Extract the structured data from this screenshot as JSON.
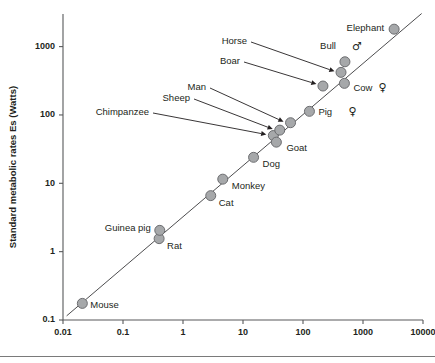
{
  "chart_data": {
    "type": "scatter",
    "title": "",
    "xlabel": "",
    "ylabel": "Standard metabolic rates Es (Watts)",
    "xscale": "log",
    "yscale": "log",
    "xlim": [
      0.01,
      10000
    ],
    "ylim": [
      0.1,
      3000
    ],
    "grid": false,
    "legend": null,
    "xticks": [
      "0.01",
      "0.1",
      "1",
      "10",
      "100",
      "1000",
      "10000"
    ],
    "xtick_values": [
      0.01,
      0.1,
      1,
      10,
      100,
      1000,
      10000
    ],
    "yticks": [
      "0.1",
      "1",
      "10",
      "100",
      "1000"
    ],
    "ytick_values": [
      0.1,
      1,
      10,
      100,
      1000
    ],
    "fit_line": {
      "label": "",
      "x_start": 0.0115,
      "y_start": 0.115,
      "x_end": 9500,
      "y_end": 3050
    },
    "points": [
      {
        "name": "Mouse",
        "x": 0.021,
        "y": 0.175,
        "label": "Mouse",
        "label_pos": "right",
        "sex": ""
      },
      {
        "name": "Rat",
        "x": 0.4,
        "y": 1.55,
        "label": "Rat",
        "label_pos": "right",
        "sex": ""
      },
      {
        "name": "Guinea pig",
        "x": 0.41,
        "y": 2.05,
        "label": "Guinea pig",
        "label_pos": "left",
        "sex": ""
      },
      {
        "name": "Cat",
        "x": 2.9,
        "y": 6.6,
        "label": "Cat",
        "label_pos": "right",
        "sex": ""
      },
      {
        "name": "Monkey",
        "x": 4.6,
        "y": 11.5,
        "label": "Monkey",
        "label_pos": "right",
        "sex": ""
      },
      {
        "name": "Dog",
        "x": 15.0,
        "y": 24.0,
        "label": "Dog",
        "label_pos": "right",
        "sex": ""
      },
      {
        "name": "Chimpanzee",
        "x": 32.0,
        "y": 50.0,
        "label": "Chimpanzee",
        "label_pos": "arrow",
        "sex": ""
      },
      {
        "name": "Goat",
        "x": 36.0,
        "y": 40.0,
        "label": "Goat",
        "label_pos": "right",
        "sex": ""
      },
      {
        "name": "Sheep",
        "x": 41.0,
        "y": 60.0,
        "label": "Sheep",
        "label_pos": "arrow",
        "sex": ""
      },
      {
        "name": "Man",
        "x": 62.0,
        "y": 77.0,
        "label": "Man",
        "label_pos": "arrow",
        "sex": ""
      },
      {
        "name": "Pig",
        "x": 128.0,
        "y": 113.0,
        "label": "Pig",
        "label_pos": "right",
        "sex": "female"
      },
      {
        "name": "Boar",
        "x": 215.0,
        "y": 265.0,
        "label": "Boar",
        "label_pos": "arrow",
        "sex": ""
      },
      {
        "name": "Horse",
        "x": 430.0,
        "y": 420.0,
        "label": "Horse",
        "label_pos": "arrow",
        "sex": ""
      },
      {
        "name": "Bull",
        "x": 500.0,
        "y": 600.0,
        "label": "Bull",
        "label_pos": "above",
        "sex": "male"
      },
      {
        "name": "Cow",
        "x": 490.0,
        "y": 290.0,
        "label": "Cow",
        "label_pos": "right",
        "sex": "female"
      },
      {
        "name": "Elephant",
        "x": 3300.0,
        "y": 1800.0,
        "label": "Elephant",
        "label_pos": "left",
        "sex": ""
      }
    ],
    "annotations": [
      {
        "text": "Horse",
        "target": "Horse"
      },
      {
        "text": "Boar",
        "target": "Boar"
      },
      {
        "text": "Man",
        "target": "Man"
      },
      {
        "text": "Sheep",
        "target": "Sheep"
      },
      {
        "text": "Chimpanzee",
        "target": "Chimpanzee"
      }
    ],
    "symbols": {
      "male": "♂",
      "female": "♀"
    }
  },
  "colors": {
    "marker_fill": "#a6a8aa",
    "marker_stroke": "#6d6e71",
    "axis": "#58595b",
    "fit_line": "#4d4d4f",
    "text": "#231f20",
    "background": "#ffffff"
  }
}
